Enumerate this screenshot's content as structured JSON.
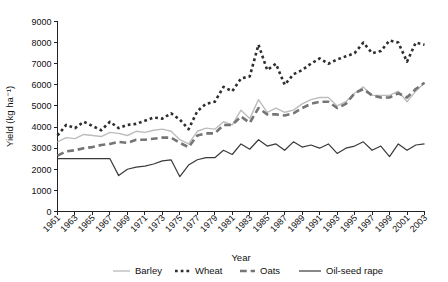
{
  "chart_data": {
    "type": "line",
    "title": "",
    "xlabel": "Year",
    "ylabel": "Yield (kg ha⁻¹)",
    "xlim": [
      1961,
      2003
    ],
    "ylim": [
      0,
      9000
    ],
    "ytick_step": 1000,
    "xtick_step": 2,
    "grid": false,
    "legend_position": "bottom",
    "yticks": [
      0,
      1000,
      2000,
      3000,
      4000,
      5000,
      6000,
      7000,
      8000,
      9000
    ],
    "x": [
      1961,
      1962,
      1963,
      1964,
      1965,
      1966,
      1967,
      1968,
      1969,
      1970,
      1971,
      1972,
      1973,
      1974,
      1975,
      1976,
      1977,
      1978,
      1979,
      1980,
      1981,
      1982,
      1983,
      1984,
      1985,
      1986,
      1987,
      1988,
      1989,
      1990,
      1991,
      1992,
      1993,
      1994,
      1995,
      1996,
      1997,
      1998,
      1999,
      2000,
      2001,
      2002,
      2003
    ],
    "xtick_labels": [
      "1961",
      "1963",
      "1965",
      "1967",
      "1969",
      "1971",
      "1973",
      "1975",
      "1977",
      "1979",
      "1981",
      "1983",
      "1985",
      "1987",
      "1989",
      "1991",
      "1993",
      "1995",
      "1997",
      "1999",
      "2001",
      "2003"
    ],
    "series": [
      {
        "name": "Barley",
        "color": "#bdbdbd",
        "style": "solid",
        "width": 1.4,
        "values": [
          3300,
          3500,
          3450,
          3650,
          3600,
          3550,
          3750,
          3700,
          3600,
          3800,
          3750,
          3850,
          3900,
          3800,
          3400,
          3200,
          3800,
          3950,
          3900,
          4250,
          4100,
          4800,
          4400,
          5300,
          4700,
          4900,
          4700,
          4800,
          5100,
          5300,
          5400,
          5400,
          5000,
          5200,
          5600,
          5900,
          5500,
          5500,
          5500,
          5700,
          5200,
          5700,
          6100
        ]
      },
      {
        "name": "Wheat",
        "color": "#2e2e2e",
        "style": "dotted",
        "width": 2.6,
        "values": [
          3600,
          4100,
          3950,
          4250,
          4050,
          3850,
          4250,
          3950,
          4100,
          4150,
          4300,
          4450,
          4400,
          4650,
          4350,
          3900,
          4750,
          5100,
          5200,
          5900,
          5700,
          6300,
          6400,
          7900,
          6700,
          7000,
          6000,
          6500,
          6700,
          7000,
          7250,
          7000,
          7200,
          7350,
          7500,
          8000,
          7500,
          7600,
          8100,
          8000,
          7100,
          8000,
          7900
        ]
      },
      {
        "name": "Oats",
        "color": "#757575",
        "style": "dashed",
        "width": 2.6,
        "values": [
          2650,
          2850,
          2900,
          3000,
          3050,
          3150,
          3200,
          3300,
          3250,
          3400,
          3400,
          3450,
          3500,
          3500,
          3250,
          3050,
          3600,
          3700,
          3700,
          4100,
          4100,
          4500,
          4200,
          4900,
          4600,
          4600,
          4550,
          4650,
          4900,
          5100,
          5200,
          5200,
          4900,
          5100,
          5600,
          5800,
          5500,
          5400,
          5400,
          5600,
          5400,
          5800,
          6100
        ]
      },
      {
        "name": "Oil-seed rape",
        "color": "#3a3a3a",
        "style": "solid",
        "width": 1.2,
        "values": [
          2500,
          2500,
          2500,
          2500,
          2500,
          2500,
          2500,
          1700,
          2000,
          2100,
          2150,
          2250,
          2400,
          2450,
          1650,
          2200,
          2450,
          2550,
          2550,
          2900,
          2700,
          3200,
          2950,
          3400,
          3100,
          3200,
          2900,
          3300,
          3050,
          3150,
          3000,
          3200,
          2750,
          3000,
          3100,
          3300,
          2900,
          3100,
          2600,
          3200,
          2900,
          3150,
          3200
        ]
      }
    ]
  },
  "legend": {
    "items": [
      {
        "label": "Barley"
      },
      {
        "label": "Wheat"
      },
      {
        "label": "Oats"
      },
      {
        "label": "Oil-seed rape"
      }
    ]
  }
}
